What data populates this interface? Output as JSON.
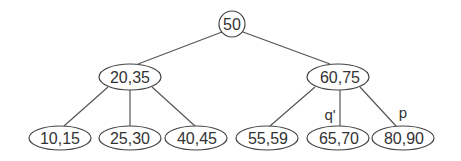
{
  "diagram": {
    "type": "tree",
    "colors": {
      "stroke": "#444444",
      "text": "#333333",
      "background": "#ffffff"
    },
    "root": {
      "id": "root",
      "label": "50",
      "shape": "circle"
    },
    "internal": [
      {
        "id": "left",
        "label": "20,35",
        "shape": "ellipse"
      },
      {
        "id": "right",
        "label": "60,75",
        "shape": "ellipse"
      }
    ],
    "leaves": [
      {
        "id": "leaf1",
        "label": "10,15",
        "parent": "left"
      },
      {
        "id": "leaf2",
        "label": "25,30",
        "parent": "left"
      },
      {
        "id": "leaf3",
        "label": "40,45",
        "parent": "left"
      },
      {
        "id": "leaf4",
        "label": "55,59",
        "parent": "right"
      },
      {
        "id": "leaf5",
        "label": "65,70",
        "parent": "right"
      },
      {
        "id": "leaf6",
        "label": "80,90",
        "parent": "right"
      }
    ],
    "edge_labels": [
      {
        "edge": "right-leaf5",
        "label": "q'"
      },
      {
        "edge": "right-leaf6",
        "label": "p"
      }
    ]
  }
}
